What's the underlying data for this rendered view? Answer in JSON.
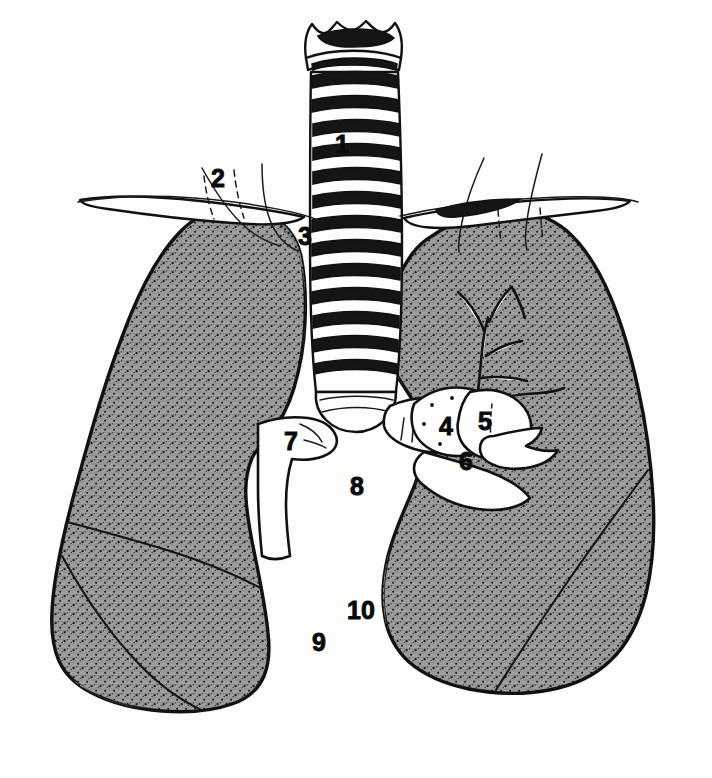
{
  "figure": {
    "background_color": "#fdfdfb",
    "ink_color": "#111111",
    "lung_fill_color": "#9a9a9a",
    "lung_fill_dark_color": "#8a8a8a",
    "structure_fill_color": "#fefefe",
    "style": "black and white line drawing with stippled halftone shading",
    "numbered_labels": [
      {
        "id": "1",
        "text": "1",
        "x": 342,
        "y": 153,
        "target": "trachea"
      },
      {
        "id": "2",
        "text": "2",
        "x": 218,
        "y": 187,
        "target": "clavicle-left"
      },
      {
        "id": "3",
        "text": "3",
        "x": 305,
        "y": 245,
        "target": "lung-apex-right"
      },
      {
        "id": "4",
        "text": "4",
        "x": 446,
        "y": 435,
        "target": "pulmonary-artery"
      },
      {
        "id": "5",
        "text": "5",
        "x": 485,
        "y": 430,
        "target": "main-bronchus-left"
      },
      {
        "id": "6",
        "text": "6",
        "x": 466,
        "y": 470,
        "target": "pulmonary-vein"
      },
      {
        "id": "7",
        "text": "7",
        "x": 291,
        "y": 450,
        "target": "main-bronchus-right"
      },
      {
        "id": "8",
        "text": "8",
        "x": 357,
        "y": 495,
        "target": "mediastinum"
      },
      {
        "id": "9",
        "text": "9",
        "x": 319,
        "y": 651,
        "target": "lung-base-left"
      },
      {
        "id": "10",
        "text": "10",
        "x": 361,
        "y": 619,
        "target": "cardiac-notch"
      }
    ],
    "structures": [
      {
        "name": "larynx",
        "kind": "cartilage",
        "label": null
      },
      {
        "name": "trachea",
        "kind": "airway",
        "label": "1"
      },
      {
        "name": "clavicle-left",
        "kind": "bone",
        "label": "2"
      },
      {
        "name": "clavicle-right",
        "kind": "bone",
        "label": null
      },
      {
        "name": "rib-outline-left",
        "kind": "bone",
        "label": null
      },
      {
        "name": "rib-outline-right",
        "kind": "bone",
        "label": null
      },
      {
        "name": "lung-left",
        "kind": "organ",
        "label": "3"
      },
      {
        "name": "lung-right",
        "kind": "organ",
        "label": null
      },
      {
        "name": "carina",
        "kind": "airway",
        "label": null
      },
      {
        "name": "main-bronchus-right",
        "kind": "airway",
        "label": "7"
      },
      {
        "name": "main-bronchus-left",
        "kind": "airway",
        "label": "5"
      },
      {
        "name": "pulmonary-artery",
        "kind": "vessel",
        "label": "4"
      },
      {
        "name": "pulmonary-vein",
        "kind": "vessel",
        "label": "6"
      },
      {
        "name": "bronchial-tree",
        "kind": "airway",
        "label": null
      },
      {
        "name": "horizontal-fissure",
        "kind": "fissure",
        "label": null
      },
      {
        "name": "oblique-fissure",
        "kind": "fissure",
        "label": null
      },
      {
        "name": "mediastinum",
        "kind": "space",
        "label": "8"
      },
      {
        "name": "lung-base-left",
        "kind": "organ",
        "label": "9"
      },
      {
        "name": "cardiac-notch",
        "kind": "space",
        "label": "10"
      }
    ]
  }
}
